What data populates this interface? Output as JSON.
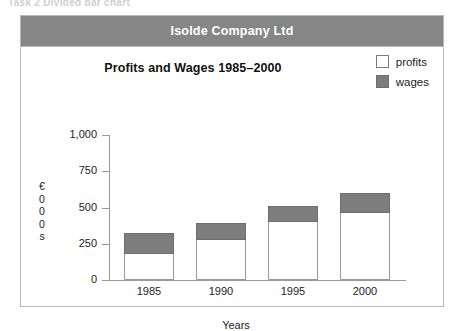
{
  "top_caption": "Task 2   Divided bar chart",
  "banner": {
    "title": "Isolde Company Ltd"
  },
  "legend": {
    "items": [
      {
        "label": "profits",
        "key": "profits",
        "color": "#ffffff"
      },
      {
        "label": "wages",
        "key": "wages",
        "color": "#7d7d7d"
      }
    ]
  },
  "axis": {
    "unit_label_chars": [
      "€",
      "0",
      "0",
      "0",
      "s"
    ],
    "unit_label": "€000s",
    "x_title": "Years"
  },
  "chart_data": {
    "type": "bar",
    "stacked": true,
    "title": "Profits and Wages 1985–2000",
    "xlabel": "Years",
    "ylabel": "€000s",
    "categories": [
      "1985",
      "1990",
      "1995",
      "2000"
    ],
    "ylim": [
      0,
      1000
    ],
    "yticks": [
      0,
      250,
      500,
      750,
      1000
    ],
    "ytick_labels": [
      "0",
      "250",
      "500",
      "750",
      "1,000"
    ],
    "grid": false,
    "legend_position": "top-right",
    "series": [
      {
        "name": "profits",
        "color": "#ffffff",
        "values": [
          180,
          275,
          400,
          465
        ]
      },
      {
        "name": "wages",
        "color": "#7d7d7d",
        "values": [
          145,
          115,
          110,
          135
        ]
      }
    ],
    "totals": [
      325,
      390,
      510,
      600
    ]
  }
}
